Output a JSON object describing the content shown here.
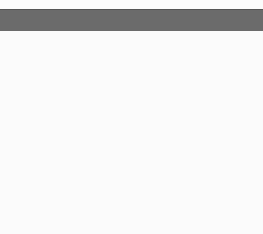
{
  "chart_data": {
    "type": "line",
    "xlabel": "x",
    "ylabel": "y",
    "origin_label": "O",
    "xlim": [
      -10,
      10
    ],
    "ylim": [
      -8.5,
      8.3
    ],
    "x_ticks": [
      -8,
      -6,
      -4,
      -2,
      2,
      4,
      6,
      8
    ],
    "y_ticks": [
      6,
      4,
      2,
      -2,
      -4,
      -6
    ],
    "grid": true,
    "series": [
      {
        "name": "y = 2",
        "x": [
          -10,
          10
        ],
        "y": [
          2,
          2
        ]
      }
    ]
  }
}
